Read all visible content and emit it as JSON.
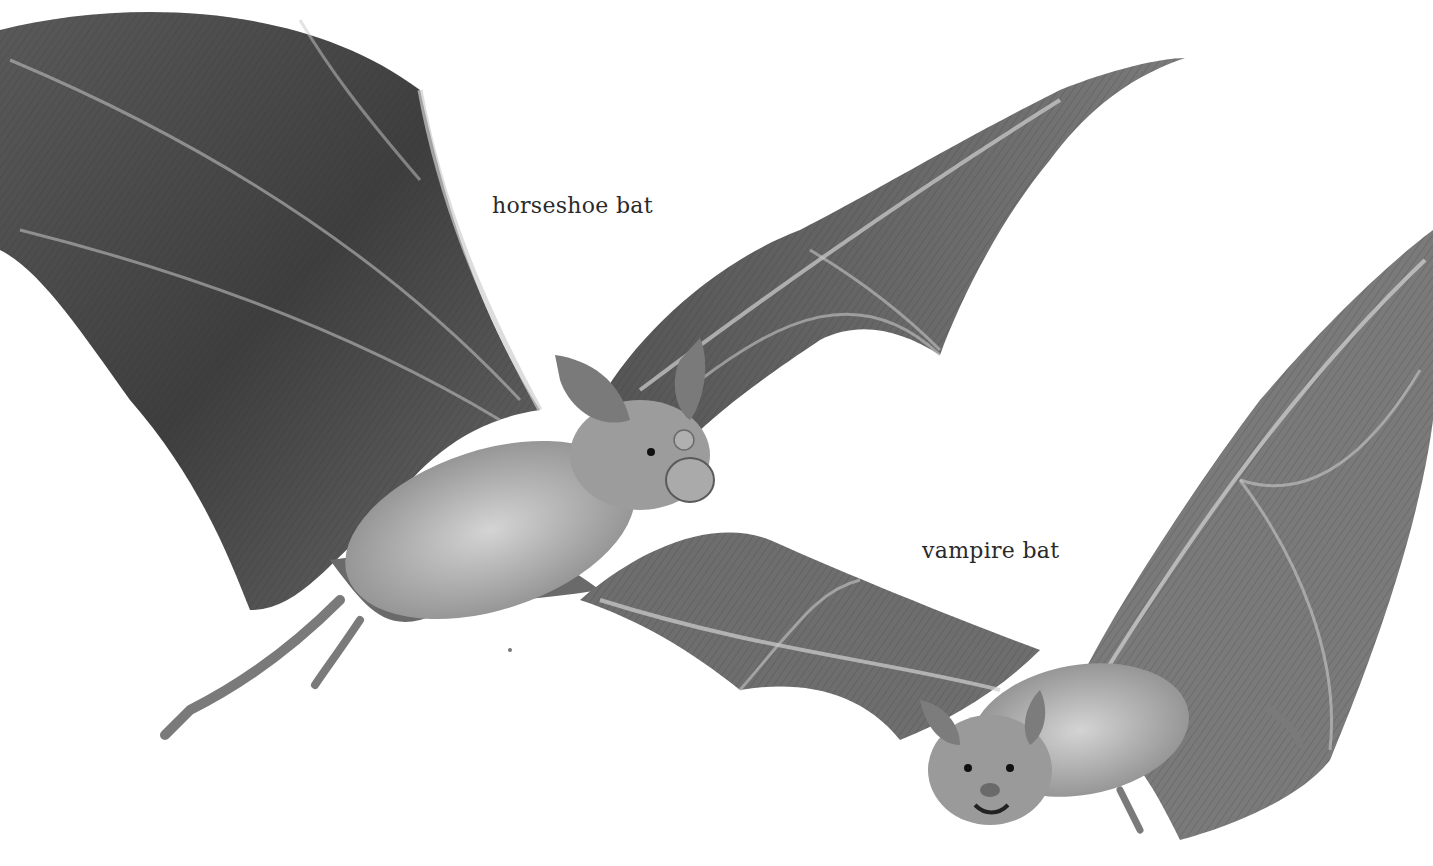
{
  "illustration": {
    "subject": "bats in flight",
    "style": "grayscale pencil illustration"
  },
  "labels": {
    "horseshoe": "horseshoe bat",
    "vampire": "vampire bat"
  },
  "colors": {
    "background": "#ffffff",
    "wing_dark": "#4a4a4a",
    "wing_mid": "#6e6e6e",
    "wing_light": "#9a9a9a",
    "body_fur": "#b8b8b8",
    "bone": "#d8d8d8",
    "text": "#2a2a2a"
  }
}
